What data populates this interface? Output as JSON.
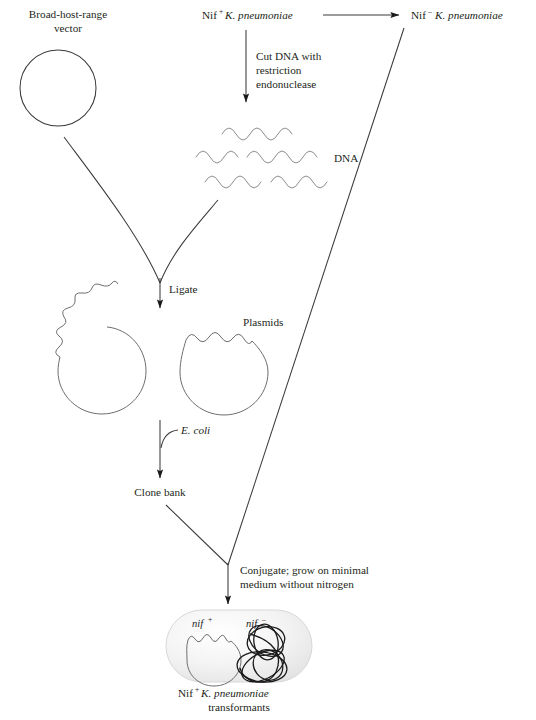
{
  "figure": {
    "title_text": "Cloning of nif genes into a broad-host-range vector",
    "background_color": "#ffffff",
    "ink_color": "#231f20",
    "dna_color": "#8c8c8c",
    "tangle_color": "#1a1a1a",
    "cell_fill_color": "#efefef"
  },
  "labels": {
    "vector_line1": "Broad-host-range",
    "vector_line2": "vector",
    "source_strain_prefix": "Nif",
    "source_strain_sup": "+",
    "source_strain_species": "K. pneumoniae",
    "mutant_strain_prefix": "Nif",
    "mutant_strain_sup": "–",
    "mutant_strain_species": "K. pneumoniae",
    "cut_step_line1": "Cut DNA with",
    "cut_step_line2": "restriction",
    "cut_step_line3": "endonuclease",
    "dna": "DNA",
    "ligate": "Ligate",
    "plasmids": "Plasmids",
    "ecoli": "E. coli",
    "clone_bank": "Clone bank",
    "conjugate_line1": "Conjugate; grow on minimal",
    "conjugate_line2": "medium without nitrogen",
    "nif_plus_prefix": "nif",
    "nif_plus_sup": "+",
    "nif_minus_prefix": "nif",
    "nif_minus_sup": "–",
    "result_prefix": "Nif",
    "result_sup": "+",
    "result_species": "K. pneumoniae",
    "result_line2": "transformants"
  },
  "elements": {
    "vector_circle_name": "broad-host-range-vector-circle",
    "dna_fragment_count": 5,
    "plasmid_count": 2,
    "cell_name": "transformant-cell",
    "nif_plus_plasmid_name": "nif-plus-plasmid",
    "nif_minus_chromosome_name": "nif-minus-chromosome"
  }
}
